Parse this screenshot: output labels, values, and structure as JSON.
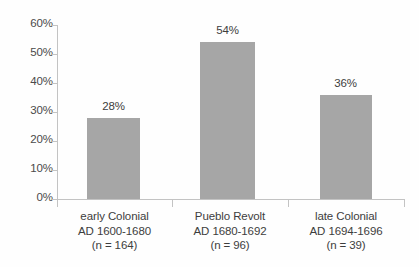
{
  "chart_data": {
    "type": "bar",
    "title": "",
    "subtitle": "",
    "xlabel": "",
    "ylabel": "",
    "ylim": [
      0,
      60
    ],
    "grid": false,
    "legend": false,
    "legend_position": "none",
    "bar_color": "#a6a6a6",
    "axis_color": "#c3c3c3",
    "text_color": "#3d3d3d",
    "background_color": "#ffffff",
    "y_ticks": [
      "0%",
      "10%",
      "20%",
      "30%",
      "40%",
      "50%",
      "60%"
    ],
    "y_tick_values": [
      0,
      10,
      20,
      30,
      40,
      50,
      60
    ],
    "categories": [
      "early Colonial AD 1600-1680 (n = 164)",
      "Pueblo Revolt AD 1680-1692 (n = 96)",
      "late Colonial AD 1694-1696 (n = 39)"
    ],
    "values": [
      28,
      54,
      36
    ],
    "data_labels": [
      "28%",
      "54%",
      "36%"
    ],
    "bars": [
      {
        "name": "early Colonial",
        "period": "AD 1600-1680",
        "sample": "(n = 164)",
        "value": 28,
        "label": "28%"
      },
      {
        "name": "Pueblo Revolt",
        "period": "AD 1680-1692",
        "sample": "(n = 96)",
        "value": 54,
        "label": "54%"
      },
      {
        "name": "late Colonial",
        "period": "AD 1694-1696",
        "sample": "(n = 39)",
        "value": 36,
        "label": "36%"
      }
    ]
  }
}
